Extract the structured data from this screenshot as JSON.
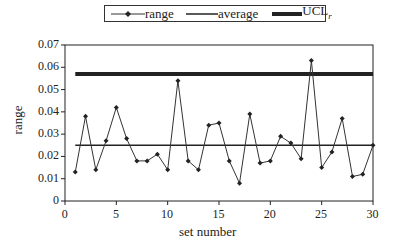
{
  "chart_data": {
    "type": "line",
    "title": "",
    "xlabel": "set number",
    "ylabel": "range",
    "xlim": [
      0,
      30
    ],
    "ylim": [
      0,
      0.07
    ],
    "x_ticks": [
      "0",
      "5",
      "10",
      "15",
      "20",
      "25",
      "30"
    ],
    "y_ticks": [
      "0",
      "0.01",
      "0.02",
      "0.03",
      "0.04",
      "0.05",
      "0.06",
      "0.07"
    ],
    "grid": false,
    "legend_position": "top",
    "x": [
      1,
      2,
      3,
      4,
      5,
      6,
      7,
      8,
      9,
      10,
      11,
      12,
      13,
      14,
      15,
      16,
      17,
      18,
      19,
      20,
      21,
      22,
      23,
      24,
      25,
      26,
      27,
      28,
      29,
      30
    ],
    "series": [
      {
        "name": "range",
        "style": "thin line with diamond markers",
        "values": [
          0.013,
          0.038,
          0.014,
          0.027,
          0.042,
          0.028,
          0.018,
          0.018,
          0.021,
          0.014,
          0.054,
          0.018,
          0.014,
          0.034,
          0.035,
          0.018,
          0.008,
          0.039,
          0.017,
          0.018,
          0.029,
          0.026,
          0.019,
          0.063,
          0.015,
          0.022,
          0.037,
          0.011,
          0.012,
          0.025
        ]
      },
      {
        "name": "average",
        "style": "medium line",
        "values_constant": 0.025
      },
      {
        "name": "UCL_r",
        "style": "thick line",
        "values_constant": 0.057
      }
    ]
  },
  "legend": {
    "range": "range",
    "average": "average",
    "ucl_main": "UCL",
    "ucl_sub": "r"
  },
  "axes": {
    "xlabel": "set number",
    "ylabel": "range"
  }
}
